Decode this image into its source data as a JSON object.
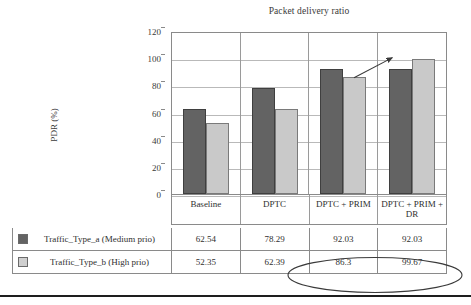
{
  "chart_data": {
    "type": "bar",
    "title": "Packet delivery ratio",
    "xlabel": "",
    "ylabel": "PDR (%)",
    "ylim": [
      0,
      120
    ],
    "yticks": [
      0,
      20,
      40,
      60,
      80,
      100,
      120
    ],
    "grid": true,
    "legend_position": "bottom-table",
    "categories": [
      "Baseline",
      "DPTC",
      "DPTC + PRIM",
      "DPTC + PRIM + DR"
    ],
    "series": [
      {
        "name": "Traffic_Type_a (Medium prio)",
        "color": "#636363",
        "values": [
          62.54,
          78.29,
          92.03,
          92.03
        ]
      },
      {
        "name": "Traffic_Type_b (High prio)",
        "color": "#c9c9c9",
        "values": [
          52.35,
          62.39,
          86.3,
          99.67
        ]
      }
    ],
    "annotations": [
      {
        "type": "arrow",
        "from_category": "DPTC + PRIM",
        "from_series": "Traffic_Type_b (High prio)",
        "to_category": "DPTC + PRIM + DR",
        "to_series": "Traffic_Type_b (High prio)"
      },
      {
        "type": "ellipse",
        "encircles": [
          "86.3",
          "99.67"
        ]
      }
    ]
  },
  "chart": {
    "title": "Packet delivery ratio",
    "y_axis_title": "PDR (%)",
    "y_ticks": [
      "120",
      "100",
      "80",
      "60",
      "40",
      "20",
      "0"
    ],
    "categories": [
      "Baseline",
      "DPTC",
      "DPTC + PRIM",
      "DPTC + PRIM + DR"
    ]
  },
  "legend": {
    "series_a_label": "Traffic_Type_a (Medium prio)",
    "series_b_label": "Traffic_Type_b (High prio)"
  },
  "table": {
    "rows": [
      {
        "label": "Traffic_Type_a (Medium prio)",
        "values": [
          "62.54",
          "78.29",
          "92.03",
          "92.03"
        ]
      },
      {
        "label": "Traffic_Type_b (High prio)",
        "values": [
          "52.35",
          "62.39",
          "86.3",
          "99.67"
        ]
      }
    ]
  },
  "colors": {
    "series_a": "#636363",
    "series_b": "#c9c9c9",
    "axis": "#8a8a8a",
    "grid": "#b9b9b9",
    "text": "#2f2f2f"
  }
}
